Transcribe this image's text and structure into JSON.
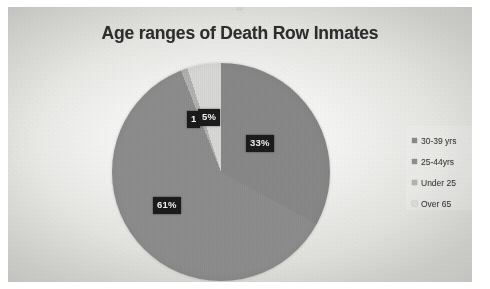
{
  "photo": {
    "background_color": "#e8e8e5",
    "note_speck": "dust-speck"
  },
  "chart_data": {
    "type": "pie",
    "title": "Age ranges of Death Row Inmates",
    "xlabel": "",
    "ylabel": "",
    "grid": false,
    "legend_position": "right",
    "categories": [
      "30-39 yrs",
      "25-44yrs",
      "Under 25",
      "Over 65"
    ],
    "values": [
      33,
      61,
      1,
      5
    ],
    "data_labels": [
      "33%",
      "61%",
      "1",
      "5%"
    ],
    "slice_colors": [
      "#8a8a8a",
      "#8f8f8f",
      "#b4b4b2",
      "#dcdcda"
    ],
    "start_angle_deg": 0,
    "direction": "clockwise",
    "slices": [
      {
        "label": "30-39 yrs",
        "value": 33,
        "data_label": "33%",
        "color": "#8a8a8a"
      },
      {
        "label": "25-44yrs",
        "value": 61,
        "data_label": "61%",
        "color": "#8f8f8f"
      },
      {
        "label": "Under 25",
        "value": 1,
        "data_label": "1",
        "color": "#b4b4b2"
      },
      {
        "label": "Over 65",
        "value": 5,
        "data_label": "5%",
        "color": "#dcdcda"
      }
    ]
  },
  "title": {
    "text": "Age ranges of Death Row Inmates",
    "color": "#2e2e2e"
  },
  "labels": {
    "pct_33": "33%",
    "pct_61": "61%",
    "pct_1": "1",
    "pct_5": "5%"
  },
  "legend": {
    "items": [
      {
        "label": "30-39 yrs",
        "color": "#8a8a8a"
      },
      {
        "label": "25-44yrs",
        "color": "#8f8f8f"
      },
      {
        "label": "Under 25",
        "color": "#b4b4b2"
      },
      {
        "label": "Over 65",
        "color": "#dcdcda"
      }
    ]
  }
}
